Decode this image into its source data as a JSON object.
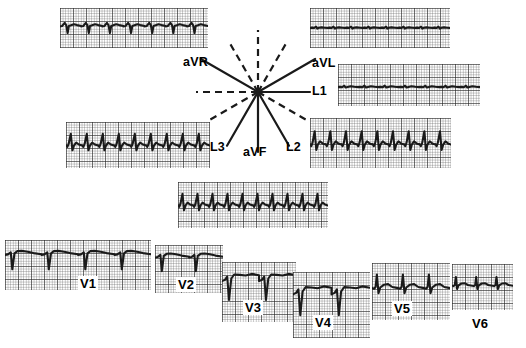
{
  "figure": {
    "type": "ecg-12-lead-diagram",
    "ink_color": "#1a1a1a",
    "grid_color": "#555555",
    "grid_bold_color": "#222222",
    "background": "#ffffff"
  },
  "hexaxial": {
    "center": {
      "x": 258,
      "y": 92
    },
    "axes": [
      {
        "label": "aVR",
        "angle_deg": -150,
        "positive_len": 66,
        "negative_len": 60,
        "label_x": 183,
        "label_y": 56
      },
      {
        "label": "aVL",
        "angle_deg": -30,
        "positive_len": 66,
        "negative_len": 60,
        "label_x": 312,
        "label_y": 57
      },
      {
        "label": "L1",
        "angle_deg": 0,
        "positive_len": 52,
        "negative_len": 62,
        "label_x": 312,
        "label_y": 85
      },
      {
        "label": "L2",
        "angle_deg": 60,
        "positive_len": 62,
        "negative_len": 58,
        "label_x": 286,
        "label_y": 141
      },
      {
        "label": "aVF",
        "angle_deg": 90,
        "positive_len": 60,
        "negative_len": 62,
        "label_x": 243,
        "label_y": 146
      },
      {
        "label": "L3",
        "angle_deg": 120,
        "positive_len": 62,
        "negative_len": 58,
        "label_x": 210,
        "label_y": 141
      }
    ]
  },
  "strips": [
    {
      "lead": "aVR",
      "label": "",
      "x": 60,
      "y": 8,
      "w": 148,
      "h": 40,
      "beats": 7,
      "baseline": 0.46,
      "amp": 1.0,
      "morphology": "inverted-qrs-negative"
    },
    {
      "lead": "aVL",
      "label": "",
      "x": 310,
      "y": 8,
      "w": 140,
      "h": 40,
      "beats": 8,
      "baseline": 0.5,
      "amp": 0.42,
      "morphology": "low-voltage"
    },
    {
      "lead": "L1",
      "label": "",
      "x": 338,
      "y": 64,
      "w": 142,
      "h": 42,
      "beats": 7,
      "baseline": 0.55,
      "amp": 0.38,
      "morphology": "low-voltage-upright"
    },
    {
      "lead": "L3",
      "label": "",
      "x": 66,
      "y": 122,
      "w": 144,
      "h": 46,
      "beats": 9,
      "baseline": 0.5,
      "amp": 0.95,
      "morphology": "tall-sharp-upright"
    },
    {
      "lead": "L2",
      "label": "",
      "x": 310,
      "y": 118,
      "w": 141,
      "h": 50,
      "beats": 9,
      "baseline": 0.52,
      "amp": 1.0,
      "morphology": "tall-sharp-upright"
    },
    {
      "lead": "aVF",
      "label": "",
      "x": 178,
      "y": 182,
      "w": 150,
      "h": 46,
      "beats": 10,
      "baseline": 0.5,
      "amp": 0.95,
      "morphology": "tall-sharp-upright"
    }
  ],
  "precordial": [
    {
      "lead": "V1",
      "label": "V1",
      "x": 5,
      "y": 240,
      "w": 146,
      "h": 50,
      "beats": 4,
      "baseline": 0.3,
      "amp": 1.0,
      "morphology": "rS-deep-s",
      "label_x": 78,
      "label_y": 276
    },
    {
      "lead": "V2",
      "label": "V2",
      "x": 155,
      "y": 245,
      "w": 68,
      "h": 48,
      "beats": 2,
      "baseline": 0.26,
      "amp": 1.0,
      "morphology": "rS-deep-s",
      "label_x": 176,
      "label_y": 277
    },
    {
      "lead": "V3",
      "label": "V3",
      "x": 222,
      "y": 262,
      "w": 74,
      "h": 60,
      "beats": 2,
      "baseline": 0.33,
      "amp": 1.0,
      "morphology": "rS-deep-s-elevated-st",
      "label_x": 243,
      "label_y": 300
    },
    {
      "lead": "V4",
      "label": "V4",
      "x": 293,
      "y": 272,
      "w": 77,
      "h": 66,
      "beats": 2,
      "baseline": 0.35,
      "amp": 1.0,
      "morphology": "rS-deep-s-elevated-st",
      "label_x": 313,
      "label_y": 315
    },
    {
      "lead": "V5",
      "label": "V5",
      "x": 372,
      "y": 263,
      "w": 78,
      "h": 57,
      "beats": 3,
      "baseline": 0.45,
      "amp": 0.9,
      "morphology": "tall-r-small-s",
      "label_x": 392,
      "label_y": 301
    },
    {
      "lead": "V6",
      "label": "V6",
      "x": 452,
      "y": 264,
      "w": 61,
      "h": 46,
      "beats": 3,
      "baseline": 0.48,
      "amp": 0.72,
      "morphology": "tall-r-small-s",
      "label_x": 470,
      "label_y": 316
    }
  ]
}
